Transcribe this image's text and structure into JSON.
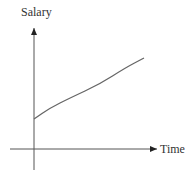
{
  "chart_data": {
    "type": "line",
    "title": "",
    "xlabel": "Time",
    "ylabel": "Salary",
    "grid": false,
    "legend": null,
    "ticks": {
      "x": [],
      "y": []
    },
    "series": [
      {
        "name": "Salary over time",
        "shape": "concave increasing (square-root-like), positive y-intercept",
        "points_px": [
          [
            34,
            119
          ],
          [
            50,
            108
          ],
          [
            70,
            98
          ],
          [
            100,
            84
          ],
          [
            125,
            68
          ],
          [
            144,
            58
          ]
        ]
      }
    ]
  },
  "colors": {
    "axis": "#444444",
    "curve": "#666666",
    "text": "#333333"
  }
}
